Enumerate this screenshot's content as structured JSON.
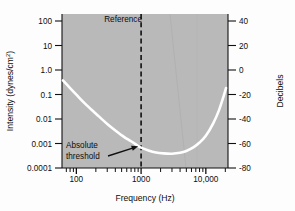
{
  "chart_data": {
    "type": "line",
    "title": "",
    "xlabel": "Frequency (Hz)",
    "ylabel": "Intensity (dynes/cm",
    "ylabel_sup": "2",
    "ylabel_suffix": ")",
    "y2label": "Decibels",
    "xscale": "log",
    "yscale": "log",
    "xlim": [
      60,
      22000
    ],
    "ylim": [
      0.0001,
      100
    ],
    "y2lim": [
      -80,
      40
    ],
    "grid": false,
    "legend": "none",
    "background_color": "#b9b9b9",
    "curve_color": "#ffffff",
    "axis_color": "#111111",
    "x_tick_labels": [
      "100",
      "1000",
      "10,000"
    ],
    "x_tick_values": [
      100,
      1000,
      10000
    ],
    "x_minor_ticks": [
      70,
      80,
      90,
      200,
      300,
      400,
      500,
      600,
      700,
      800,
      900,
      2000,
      3000,
      4000,
      5000,
      6000,
      7000,
      8000,
      9000,
      20000
    ],
    "y_tick_labels": [
      "100",
      "10",
      "1.0",
      "0.1",
      "0.01",
      "0.001",
      "0.0001"
    ],
    "y_tick_values": [
      100,
      10,
      1.0,
      0.1,
      0.01,
      0.001,
      0.0001
    ],
    "y2_tick_labels": [
      "40",
      "20",
      "0",
      "-20",
      "-40",
      "-60",
      "-80"
    ],
    "y2_tick_values": [
      40,
      20,
      0,
      -20,
      -40,
      -60,
      -80
    ],
    "series": [
      {
        "name": "Absolute threshold",
        "x": [
          62,
          80,
          100,
          130,
          170,
          220,
          300,
          400,
          550,
          700,
          900,
          1000,
          1300,
          1700,
          2200,
          3000,
          4000,
          5000,
          6500,
          8000,
          10000,
          13000,
          16000,
          19000,
          20500
        ],
        "y": [
          0.26,
          0.13,
          0.072,
          0.036,
          0.019,
          0.0105,
          0.0052,
          0.0029,
          0.0016,
          0.0011,
          0.00072,
          0.00062,
          0.00048,
          0.0004,
          0.00037,
          0.00036,
          0.00039,
          0.00046,
          0.00065,
          0.00098,
          0.0018,
          0.0055,
          0.018,
          0.068,
          0.13
        ]
      }
    ],
    "annotations": [
      {
        "name": "reference-line",
        "type": "vline",
        "label": "Reference",
        "x": 1000,
        "style": "dashed"
      },
      {
        "name": "absolute-threshold-annotation",
        "type": "arrow-label",
        "label_line1": "Absolute",
        "label_line2": "threshold",
        "points_to_x": 900,
        "points_to_y": 0.0007
      }
    ]
  }
}
